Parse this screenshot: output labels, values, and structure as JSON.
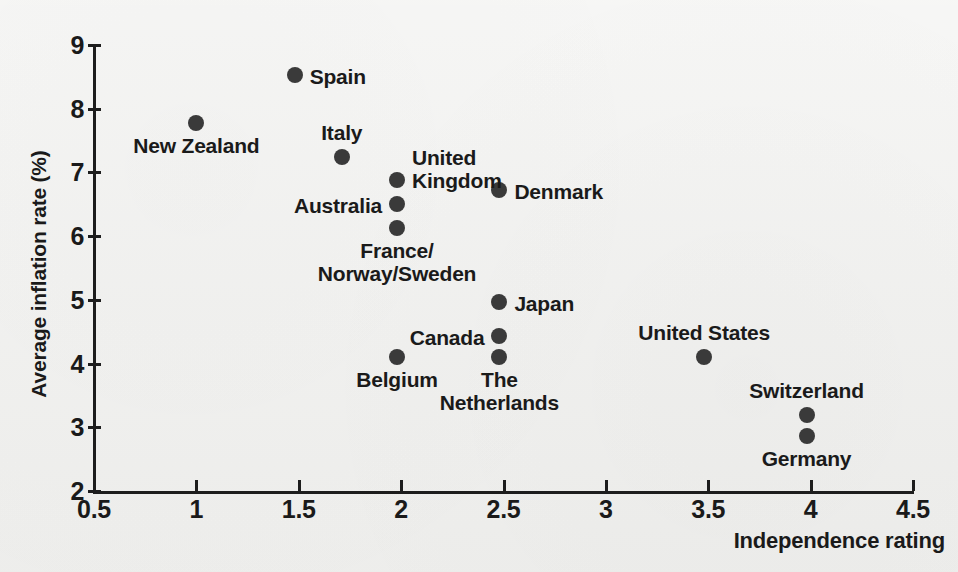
{
  "chart_data": {
    "type": "scatter",
    "title": "",
    "xlabel": "Independence rating",
    "ylabel": "Average inflation rate (%)",
    "xlim": [
      0.5,
      4.5
    ],
    "ylim": [
      2,
      9
    ],
    "xticks": [
      "0.5",
      "1",
      "1.5",
      "2",
      "2.5",
      "3",
      "3.5",
      "4",
      "4.5"
    ],
    "xtick_values": [
      0.5,
      1,
      1.5,
      2,
      2.5,
      3,
      3.5,
      4,
      4.5
    ],
    "yticks": [
      "9",
      "8",
      "7",
      "6",
      "5",
      "4",
      "3",
      "2"
    ],
    "ytick_values": [
      9,
      8,
      7,
      6,
      5,
      4,
      3,
      2
    ],
    "grid": false,
    "legend": "none",
    "marker_color": "#3a3a3a",
    "axis_color": "#1d1d1d",
    "background": "#f2f2f0",
    "points": [
      {
        "label": "Spain",
        "x": 1.48,
        "y": 8.53,
        "label_pos": "right"
      },
      {
        "label": "New Zealand",
        "x": 1.0,
        "y": 7.77,
        "label_pos": "below"
      },
      {
        "label": "Italy",
        "x": 1.71,
        "y": 7.24,
        "label_pos": "above"
      },
      {
        "label": "United\nKingdom",
        "x": 1.98,
        "y": 6.88,
        "label_pos": "right-two-line"
      },
      {
        "label": "Australia",
        "x": 1.98,
        "y": 6.5,
        "label_pos": "left"
      },
      {
        "label": "Denmark",
        "x": 2.48,
        "y": 6.73,
        "label_pos": "right"
      },
      {
        "label": "France/\nNorway/Sweden",
        "x": 1.98,
        "y": 6.13,
        "label_pos": "below-two-line"
      },
      {
        "label": "Japan",
        "x": 2.48,
        "y": 4.97,
        "label_pos": "right"
      },
      {
        "label": "Canada",
        "x": 2.48,
        "y": 4.43,
        "label_pos": "left"
      },
      {
        "label": "The\nNetherlands",
        "x": 2.48,
        "y": 4.1,
        "label_pos": "below-two-line"
      },
      {
        "label": "Belgium",
        "x": 1.98,
        "y": 4.11,
        "label_pos": "below"
      },
      {
        "label": "United States",
        "x": 3.48,
        "y": 4.1,
        "label_pos": "above"
      },
      {
        "label": "Switzerland",
        "x": 3.98,
        "y": 3.2,
        "label_pos": "above"
      },
      {
        "label": "Germany",
        "x": 3.98,
        "y": 2.87,
        "label_pos": "below"
      }
    ]
  }
}
